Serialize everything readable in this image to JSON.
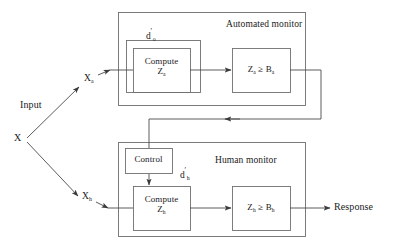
{
  "diagram": {
    "stroke_color": "#6e6e6e",
    "text_color": "#1a1a1a",
    "background": "#ffffff",
    "inputs": {
      "input_label": "Input",
      "source_label": "X",
      "branch_automated_label": "X",
      "branch_automated_sub": "a",
      "branch_human_label": "X",
      "branch_human_sub": "h"
    },
    "output": {
      "response_label": "Response"
    },
    "automated_monitor": {
      "container_label": "Automated monitor",
      "sensitivity_label": "d",
      "sensitivity_prime": "′",
      "sensitivity_sub": "o",
      "compute_line1": "Compute",
      "compute_line2": "Z",
      "compute_sub": "a",
      "criterion_z": "Z",
      "criterion_z_sub": "a",
      "criterion_op": "≥",
      "criterion_b": "B",
      "criterion_b_sub": "a"
    },
    "human_monitor": {
      "container_label": "Human monitor",
      "control_label": "Control",
      "sensitivity_label": "d",
      "sensitivity_prime": "′",
      "sensitivity_sub": "h",
      "compute_line1": "Compute",
      "compute_line2": "Z",
      "compute_sub": "h",
      "criterion_z": "Z",
      "criterion_z_sub": "h",
      "criterion_op": "≥",
      "criterion_b": "B",
      "criterion_b_sub": "h"
    }
  }
}
